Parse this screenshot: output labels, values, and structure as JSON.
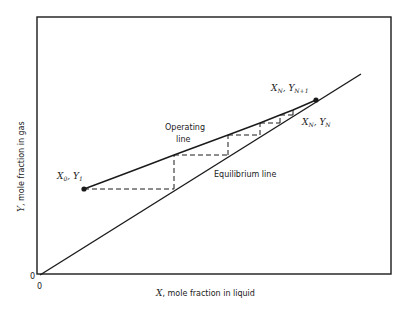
{
  "diagram": {
    "type": "mccabe-thiele-absorption",
    "axes": {
      "xlabel_var": "X",
      "xlabel_text": ", mole fraction in liquid",
      "ylabel_var": "Y",
      "ylabel_text": ", mole fraction in gas",
      "origin_x": "0",
      "origin_y": "0"
    },
    "lines": {
      "operating_line_label_1": "Operating",
      "operating_line_label_2": "line",
      "equilibrium_line_label": "Equilibrium line"
    },
    "points": {
      "start": {
        "label_x": "X",
        "label_x_sub": "0",
        "label_sep": ", ",
        "label_y": "Y",
        "label_y_sub": "1"
      },
      "end": {
        "label_x": "X",
        "label_x_sub": "N",
        "label_sep": ", ",
        "label_y": "Y",
        "label_y_sub": "N+1"
      },
      "last_stage": {
        "label_x": "X",
        "label_x_sub": "N",
        "label_sep": ", ",
        "label_y": "Y",
        "label_y_sub": "N"
      }
    },
    "colors": {
      "ink": "#1a1a1a",
      "background": "#ffffff"
    }
  }
}
